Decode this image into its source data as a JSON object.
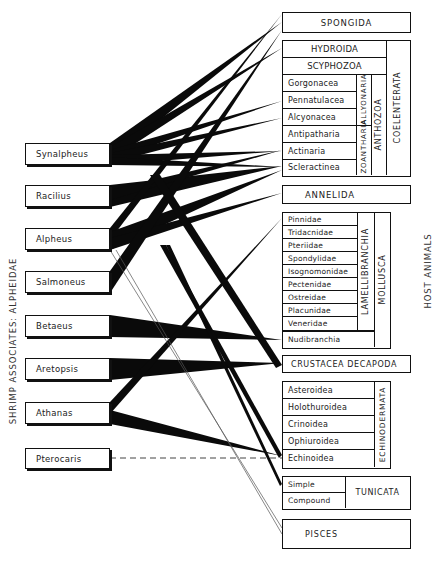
{
  "left_axis_label": "SHRIMP ASSOCIATES: ALPHEIDAE",
  "right_axis_label": "HOST ANIMALS",
  "shrimp": [
    {
      "name": "Synalpheus"
    },
    {
      "name": "Racilius"
    },
    {
      "name": "Alpheus"
    },
    {
      "name": "Salmoneus"
    },
    {
      "name": "Betaeus"
    },
    {
      "name": "Aretopsis"
    },
    {
      "name": "Athanas"
    },
    {
      "name": "Pterocaris"
    }
  ],
  "hosts": {
    "spongida": "SPONGIDA",
    "coelenterata": {
      "label": "COELENTERATA",
      "hydroida": "HYDROIDA",
      "scyphozoa": "SCYPHOZOA",
      "anthozoa": {
        "label": "ANTHOZOA",
        "alcyonaria_label": "ALLYONARIA",
        "zoantharia_label": "ZOANTHARIA",
        "alcyonaria": [
          "Gorgonacea",
          "Pennatulacea",
          "Alcyonacea"
        ],
        "zoantharia": [
          "Antipatharia",
          "Actinaria",
          "Scleractinea"
        ]
      }
    },
    "annelida": "ANNELIDA",
    "mollusca": {
      "label": "MOLLUSCA",
      "lamellibranchia_label": "LAMELLIBRANCHIA",
      "lamellibranchia": [
        "Pinnidae",
        "Tridacnidae",
        "Pteriidae",
        "Spondylidae",
        "Isognomonidae",
        "Pectenidae",
        "Ostreidae",
        "Placunidae",
        "Veneridae"
      ],
      "other": "Nudibranchia"
    },
    "crustacea": "CRUSTACEA DECAPODA",
    "echinodermata": {
      "label": "ECHINODERMATA",
      "items": [
        "Asteroidea",
        "Holothuroidea",
        "Crinoidea",
        "Ophiuroidea",
        "Echinoidea"
      ]
    },
    "tunicata": {
      "label": "TUNICATA",
      "items": [
        "Simple",
        "Compound"
      ]
    },
    "pisces": "PISCES"
  },
  "links": [
    {
      "from": "Synalpheus",
      "to": [
        "SPONGIDA",
        "HYDROIDA",
        "Pennatulacea",
        "Alcyonacea",
        "Actinaria",
        "Scleractinea",
        "CRUSTACEA DECAPODA",
        "Echinoidea"
      ]
    },
    {
      "from": "Racilius",
      "to": [
        "Scleractinea"
      ]
    },
    {
      "from": "Alpheus",
      "to": [
        "SPONGIDA",
        "Scleractinea",
        "ANNELIDA",
        "PISCES",
        "Simple"
      ]
    },
    {
      "from": "Salmoneus",
      "to": [
        "SPONGIDA"
      ]
    },
    {
      "from": "Betaeus",
      "to": [
        "Nudibranchia"
      ]
    },
    {
      "from": "Aretopsis",
      "to": [
        "CRUSTACEA DECAPODA"
      ]
    },
    {
      "from": "Athanas",
      "to": [
        "Pinnidae",
        "Echinoidea"
      ]
    },
    {
      "from": "Pterocaris",
      "to": [
        "Echinoidea"
      ],
      "style": "dashed"
    }
  ]
}
